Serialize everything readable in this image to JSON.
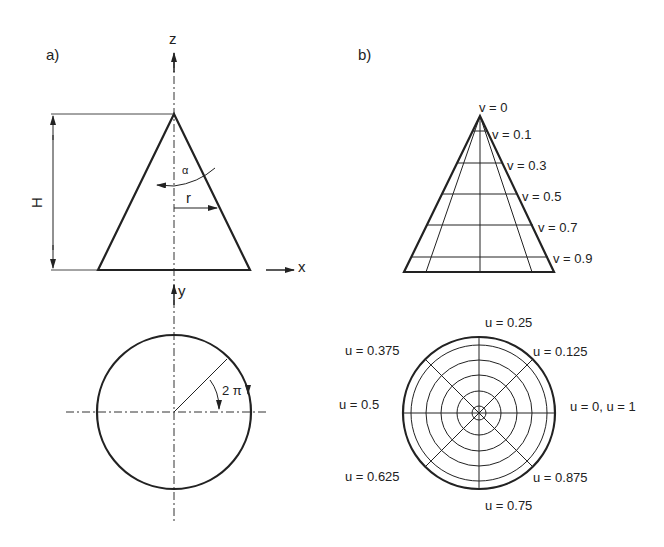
{
  "panel_a": {
    "label": "a)",
    "axes": {
      "z": "z",
      "x": "x",
      "y": "y"
    },
    "dimension_height": "H",
    "angle_symbol": "α",
    "radius_symbol": "r",
    "rotation_label": "2 π"
  },
  "panel_b": {
    "label": "b)",
    "v_labels": [
      "v = 0",
      "v = 0.1",
      "v = 0.3",
      "v = 0.5",
      "v = 0.7",
      "v = 0.9"
    ],
    "u_labels": {
      "u_025": "u = 0.25",
      "u_0125": "u = 0.125",
      "u_0375": "u = 0.375",
      "u_05": "u = 0.5",
      "u_0": "u = 0, u = 1",
      "u_0625": "u = 0.625",
      "u_0875": "u = 0.875",
      "u_075": "u = 0.75"
    }
  },
  "colors": {
    "ink": "#222222",
    "background": "#ffffff"
  }
}
